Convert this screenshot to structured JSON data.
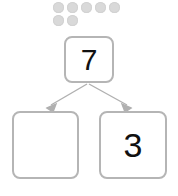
{
  "diagram": {
    "type": "number-bond",
    "title": "",
    "counters": {
      "icon": "circle-counter-icon",
      "total": 7,
      "color": "#d9d9d9",
      "rows": [
        {
          "count": 5
        },
        {
          "count": 2
        }
      ]
    },
    "total_box": {
      "label": "7",
      "filled": true
    },
    "part_boxes": [
      {
        "label": "",
        "filled": false
      },
      {
        "label": "3",
        "filled": true
      }
    ],
    "connectors": [
      {
        "name": "arrow-to-left-part",
        "icon": "arrow-down-left-icon",
        "color": "#b0b0b0"
      },
      {
        "name": "arrow-to-right-part",
        "icon": "arrow-down-right-icon",
        "color": "#b0b0b0"
      }
    ],
    "colors": {
      "box_border": "#b5b5b5",
      "box_fill": "#ffffff",
      "counter": "#d9d9d9",
      "arrow": "#b0b0b0",
      "text": "#111111",
      "background": "#ffffff"
    }
  }
}
